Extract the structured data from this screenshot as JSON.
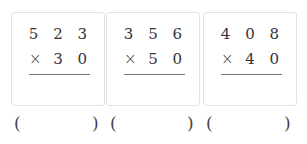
{
  "problems": [
    {
      "multiplicand": "5 2 3",
      "operator": "×",
      "multiplier": "3 0",
      "answer_open": "(",
      "answer_close": ")"
    },
    {
      "multiplicand": "3 5 6",
      "operator": "×",
      "multiplier": "5 0",
      "answer_open": "(",
      "answer_close": ")"
    },
    {
      "multiplicand": "4 0 8",
      "operator": "×",
      "multiplier": "4 0",
      "answer_open": "(",
      "answer_close": ")"
    }
  ]
}
